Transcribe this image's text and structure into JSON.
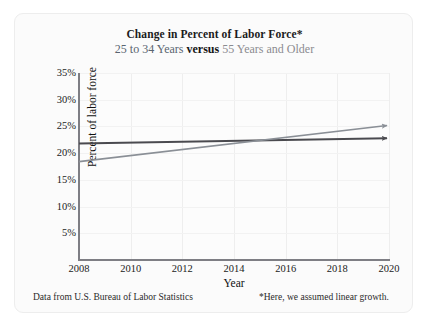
{
  "card": {
    "title": "Change in Percent of Labor Force*",
    "subtitle_part1": "25 to 34 Years",
    "subtitle_versus": "versus",
    "subtitle_part2": "55 Years and Older",
    "source_note": "Data from U.S. Bureau of Labor Statistics",
    "footnote": "*Here, we assumed linear growth."
  },
  "colors": {
    "series_young": "#8a8f96",
    "series_old": "#4a4a4f",
    "axis": "#7e7e84",
    "grid": "#eeeeee",
    "title": "#1b1b1b",
    "subtitle_a": "#5a6570",
    "subtitle_b": "#8b8b90",
    "card_background": "#fbfbfb"
  },
  "chart_data": {
    "type": "line",
    "title": "Change in Percent of Labor Force*",
    "subtitle": "25 to 34 Years versus 55 Years and Older",
    "xlabel": "Year",
    "ylabel": "Percent of labor force",
    "xlim": [
      2008,
      2020
    ],
    "ylim": [
      0,
      35
    ],
    "xticks": [
      "2008",
      "2010",
      "2012",
      "2014",
      "2016",
      "2018",
      "2020"
    ],
    "xtick_values": [
      2008,
      2010,
      2012,
      2014,
      2016,
      2018,
      2020
    ],
    "yticks": [
      "5%",
      "10%",
      "15%",
      "20%",
      "25%",
      "30%",
      "35%"
    ],
    "ytick_values": [
      5,
      10,
      15,
      20,
      25,
      30,
      35
    ],
    "grid": true,
    "legend": "none",
    "arrowheads": true,
    "x": [
      2008,
      2020
    ],
    "series": [
      {
        "name": "25 to 34 Years",
        "color": "#8a8f96",
        "values": [
          18.4,
          25.4
        ]
      },
      {
        "name": "55 Years and Older",
        "color": "#4a4a4f",
        "values": [
          21.8,
          22.8
        ]
      }
    ],
    "annotations": [
      {
        "text": "lines intersect near 2014.5 at about 22.3%",
        "x": 2014.5,
        "y": 22.3
      }
    ]
  }
}
